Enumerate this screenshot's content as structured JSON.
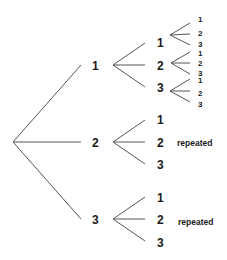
{
  "diagram": {
    "type": "tree",
    "root": "",
    "level1": [
      {
        "label": "1",
        "children": [
          {
            "label": "1",
            "children": [
              "1",
              "2",
              "3"
            ]
          },
          {
            "label": "2",
            "children": [
              "1",
              "2",
              "3"
            ]
          },
          {
            "label": "3",
            "children": [
              "1",
              "2",
              "3"
            ]
          }
        ]
      },
      {
        "label": "2",
        "children": [
          {
            "label": "1"
          },
          {
            "label": "2"
          },
          {
            "label": "3"
          }
        ],
        "note": "repeated"
      },
      {
        "label": "3",
        "children": [
          {
            "label": "1"
          },
          {
            "label": "2"
          },
          {
            "label": "3"
          }
        ],
        "note": "repeated"
      }
    ],
    "line_color": "#555555",
    "text_color": "#1a1a1a"
  }
}
